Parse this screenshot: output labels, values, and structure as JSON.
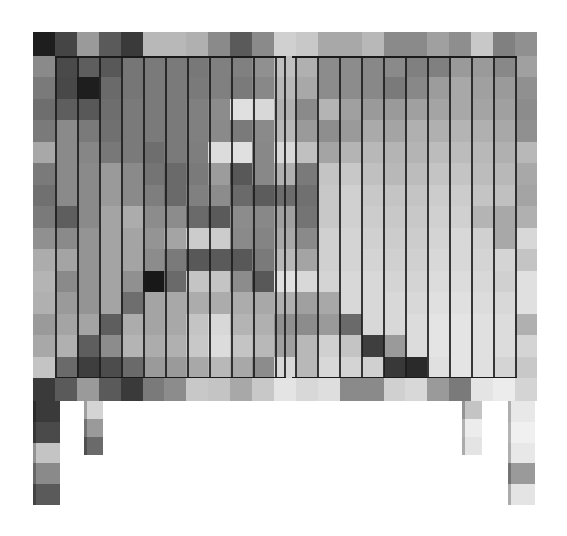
{
  "image": {
    "subject": "Pixelated grayscale sideboard cabinet with two vertical-slat doors on four legs",
    "background_color": "#ffffff"
  },
  "top_band": [
    "#1e1e1e",
    "#454545",
    "#9a9a9a",
    "#5a5a5a",
    "#3a3a3a",
    "#b8b8b8",
    "#b8b8b8",
    "#b0b0b0",
    "#8a8a8a",
    "#5a5a5a",
    "#8a8a8a",
    "#d0d0d0",
    "#c8c8c8",
    "#a8a8a8",
    "#a8a8a8",
    "#b8b8b8",
    "#8a8a8a",
    "#8a8a8a",
    "#a0a0a0",
    "#8e8e8e",
    "#c8c8c8",
    "#808080",
    "#909090"
  ],
  "body_rows": [
    [
      "#8a8a8a",
      "#4a4a4a",
      "#5e5e5e",
      "#585858",
      "#767676",
      "#7a7a7a",
      "#7a7a7a",
      "#787878",
      "#808080",
      "#808080",
      "#909090",
      "#c0c0c0",
      "#b0b0b0",
      "#8c8c8c",
      "#8c8c8c",
      "#888888",
      "#8a8a8a",
      "#808080",
      "#808080",
      "#9a9a9a",
      "#9a9a9a",
      "#888888",
      "#a0a0a0"
    ],
    [
      "#7a7a7a",
      "#484848",
      "#1e1e1e",
      "#6a6a6a",
      "#767676",
      "#7a7a7a",
      "#7a7a7a",
      "#7a7a7a",
      "#808080",
      "#7a7a7a",
      "#888888",
      "#b8b8b8",
      "#a8a8a8",
      "#8c8c8c",
      "#8c8c8c",
      "#888888",
      "#7a7a7a",
      "#888888",
      "#9c9c9c",
      "#a8a8a8",
      "#a0a0a0",
      "#9a9a9a",
      "#909090"
    ],
    [
      "#6e6e6e",
      "#5e5e5e",
      "#585858",
      "#6e6e6e",
      "#7a7a7a",
      "#7a7a7a",
      "#7a7a7a",
      "#808080",
      "#8c8c8c",
      "#e0e0e0",
      "#d8d8d8",
      "#b0b0b0",
      "#8a8a8a",
      "#b4b4b4",
      "#a0a0a0",
      "#9a9a9a",
      "#9a9a9a",
      "#a0a0a0",
      "#a4a4a4",
      "#a8a8a8",
      "#a4a4a4",
      "#a0a0a0",
      "#8c8c8c"
    ],
    [
      "#7a7a7a",
      "#8a8a8a",
      "#7a7a7a",
      "#707070",
      "#7a7a7a",
      "#7a7a7a",
      "#7a7a7a",
      "#808080",
      "#8a8a8a",
      "#7a7a7a",
      "#8a8a8a",
      "#b8b8b8",
      "#9a9a9a",
      "#8e8e8e",
      "#9a9a9a",
      "#aaaaaa",
      "#a4a4a4",
      "#b0b0b0",
      "#b0b0b0",
      "#b4b4b4",
      "#b0b0b0",
      "#a8a8a8",
      "#909090"
    ],
    [
      "#a8a8a8",
      "#8a8a8a",
      "#868686",
      "#787878",
      "#7a7a7a",
      "#6e6e6e",
      "#7a7a7a",
      "#7e7e7e",
      "#dcdcdc",
      "#e0e0e0",
      "#888888",
      "#d8d8d8",
      "#c0c0c0",
      "#a4a4a4",
      "#b4b4b4",
      "#b8b8b8",
      "#b4b4b4",
      "#b4b4b4",
      "#bcbcbc",
      "#bcbcbc",
      "#b8b8b8",
      "#b0b0b0",
      "#b8b8b8"
    ],
    [
      "#7a7a7a",
      "#8a8a8a",
      "#8a8a8a",
      "#9a9a9a",
      "#8a8a8a",
      "#747474",
      "#6a6a6a",
      "#7a7a7a",
      "#9c9c9c",
      "#585858",
      "#888888",
      "#b0b0b0",
      "#7a7a7a",
      "#c4c4c4",
      "#c8c8c8",
      "#c0c0c0",
      "#b8b8b8",
      "#bcbcbc",
      "#c4c4c4",
      "#c4c4c4",
      "#bcbcbc",
      "#b8b8b8",
      "#a8a8a8"
    ],
    [
      "#707070",
      "#8a8a8a",
      "#8a8a8a",
      "#9a9a9a",
      "#8a8a8a",
      "#7e7e7e",
      "#6a6a6a",
      "#808080",
      "#8c8c8c",
      "#6a6a6a",
      "#5c5c5c",
      "#6c6c6c",
      "#707070",
      "#c8c8c8",
      "#d0d0d0",
      "#c8c8c8",
      "#c4c4c4",
      "#c4c4c4",
      "#cccccc",
      "#cccccc",
      "#c4c4c4",
      "#c0c0c0",
      "#a4a4a4"
    ],
    [
      "#7a7a7a",
      "#5e5e5e",
      "#8a8a8a",
      "#a4a4a4",
      "#acacac",
      "#8c8c8c",
      "#8c8c8c",
      "#6a6a6a",
      "#5a5a5a",
      "#8c8c8c",
      "#888888",
      "#a0a0a0",
      "#747474",
      "#c8c8c8",
      "#d0d0d0",
      "#cccccc",
      "#c8c8c8",
      "#c8c8c8",
      "#d0d0d0",
      "#d0d0d0",
      "#b4b4b4",
      "#a8a8a8",
      "#b0b0b0"
    ],
    [
      "#909090",
      "#8a8a8a",
      "#949494",
      "#a4a4a4",
      "#a4a4a4",
      "#949494",
      "#a4a4a4",
      "#cccccc",
      "#cccccc",
      "#8a8a8a",
      "#848484",
      "#a8a8a8",
      "#8a8a8a",
      "#d0d0d0",
      "#d4d4d4",
      "#d0d0d0",
      "#cccccc",
      "#cccccc",
      "#d4d4d4",
      "#d8d8d8",
      "#d0d0d0",
      "#a8a8a8",
      "#d8d8d8"
    ],
    [
      "#acacac",
      "#a4a4a4",
      "#949494",
      "#a4a4a4",
      "#a4a4a4",
      "#8c8c8c",
      "#7a7a7a",
      "#585858",
      "#5a5a5a",
      "#585858",
      "#7a7a7a",
      "#b8b8b8",
      "#a4a4a4",
      "#d0d0d0",
      "#d4d4d4",
      "#d4d4d4",
      "#d0d0d0",
      "#d0d0d0",
      "#d8d8d8",
      "#d8d8d8",
      "#d4d4d4",
      "#d4d4d4",
      "#c4c4c4"
    ],
    [
      "#b4b4b4",
      "#8a8a8a",
      "#949494",
      "#a4a4a4",
      "#909090",
      "#181818",
      "#6a6a6a",
      "#c4c4c4",
      "#c4c4c4",
      "#8c8c8c",
      "#585858",
      "#e0e0e0",
      "#d8d8d8",
      "#d4d4d4",
      "#d8d8d8",
      "#d8d8d8",
      "#d4d4d4",
      "#d4d4d4",
      "#dcdcdc",
      "#dcdcdc",
      "#d8d8d8",
      "#d0d0d0",
      "#e0e0e0"
    ],
    [
      "#b0b0b0",
      "#9a9a9a",
      "#949494",
      "#a4a4a4",
      "#6e6e6e",
      "#a4a4a4",
      "#a8a8a8",
      "#acacac",
      "#acacac",
      "#acacac",
      "#a8a8a8",
      "#b0b0b0",
      "#a0a0a0",
      "#a8a8a8",
      "#d8d8d8",
      "#d8d8d8",
      "#d8d8d8",
      "#d8d8d8",
      "#e0e0e0",
      "#e0e0e0",
      "#dcdcdc",
      "#d8d8d8",
      "#e0e0e0"
    ],
    [
      "#9a9a9a",
      "#a4a4a4",
      "#a4a4a4",
      "#5e5e5e",
      "#acacac",
      "#a4a4a4",
      "#a8a8a8",
      "#c4c4c4",
      "#d8d8d8",
      "#b4b4b4",
      "#b0b0b0",
      "#909090",
      "#8c8c8c",
      "#9a9a9a",
      "#6a6a6a",
      "#d8d8d8",
      "#d8d8d8",
      "#dcdcdc",
      "#e4e4e4",
      "#e4e4e4",
      "#e0e0e0",
      "#dcdcdc",
      "#b0b0b0"
    ],
    [
      "#a8a8a8",
      "#b0b0b0",
      "#5e5e5e",
      "#8c8c8c",
      "#b4b4b4",
      "#acacac",
      "#b0b0b0",
      "#c8c8c8",
      "#dcdcdc",
      "#c4c4c4",
      "#b8b8b8",
      "#a0a0a0",
      "#b8b8b8",
      "#d0d0d0",
      "#c4c4c4",
      "#3e3e3e",
      "#9a9a9a",
      "#dcdcdc",
      "#e4e4e4",
      "#e4e4e4",
      "#e0e0e0",
      "#dcdcdc",
      "#d4d4d4"
    ],
    [
      "#c4c4c4",
      "#6a6a6a",
      "#3e3e3e",
      "#4c4c4c",
      "#6a6a6a",
      "#9a9a9a",
      "#9a9a9a",
      "#a8a8a8",
      "#b8b8b8",
      "#a8a8a8",
      "#8c8c8c",
      "#d8d8d8",
      "#b8b8b8",
      "#d8d8d8",
      "#d4d4d4",
      "#d0d0d0",
      "#383838",
      "#2a2a2a",
      "#e0e0e0",
      "#e4e4e4",
      "#e0e0e0",
      "#d4d4d4",
      "#c8c8c8"
    ]
  ],
  "bottom_band": [
    "#3a3a3a",
    "#5a5a5a",
    "#9a9a9a",
    "#5a5a5a",
    "#3a3a3a",
    "#7a7a7a",
    "#8c8c8c",
    "#c8c8c8",
    "#c4c4c4",
    "#a8a8a8",
    "#c8c8c8",
    "#e4e4e4",
    "#d8d8d8",
    "#dedede",
    "#8a8a8a",
    "#8a8a8a",
    "#d0d0d0",
    "#d8d8d8",
    "#9a9a9a",
    "#7a7a7a",
    "#e4e4e4",
    "#ececec",
    "#d4d4d4"
  ],
  "legs": [
    {
      "name": "front-left",
      "left": 33,
      "top": 401,
      "width": 27,
      "height": 104,
      "cells": [
        "#3a3a3a",
        "#4a4a4a",
        "#c4c4c4",
        "#8a8a8a",
        "#5a5a5a"
      ]
    },
    {
      "name": "back-left",
      "left": 84,
      "top": 401,
      "width": 19,
      "height": 54,
      "cells": [
        "#d4d4d4",
        "#9a9a9a",
        "#6a6a6a"
      ]
    },
    {
      "name": "back-right",
      "left": 462,
      "top": 401,
      "width": 20,
      "height": 54,
      "cells": [
        "#c4c4c4",
        "#ececec",
        "#e4e4e4"
      ]
    },
    {
      "name": "front-right",
      "left": 508,
      "top": 401,
      "width": 27,
      "height": 104,
      "cells": [
        "#e8e8e8",
        "#f0f0f0",
        "#e8e8e8",
        "#9a9a9a",
        "#e4e4e4"
      ]
    }
  ],
  "door_slat_lines_px": [
    22,
    44,
    66,
    88,
    110,
    132,
    154,
    176,
    198,
    220,
    242,
    251,
    262,
    284,
    306,
    328,
    350,
    372,
    394,
    416,
    438,
    460,
    482
  ],
  "door_frame": {
    "left": 22,
    "right": 482,
    "split_left": 251,
    "split_right": 259
  }
}
